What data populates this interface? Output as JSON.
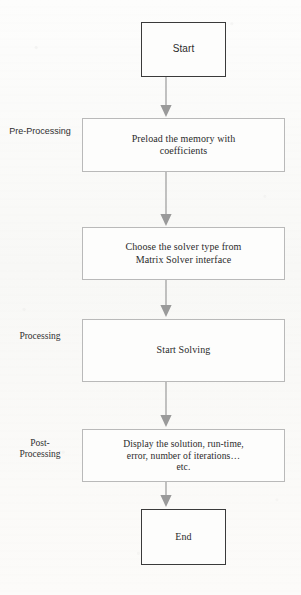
{
  "diagram": {
    "colors": {
      "page_background": "#fbfbfa",
      "box_fill": "#fdfdfc",
      "terminator_border": "#3a3a3a",
      "process_border": "#b9b9b9",
      "arrow": "#9a9a9a",
      "text": "#2b2b2b"
    },
    "stages": [
      {
        "id": "pre-processing",
        "caption": "Pre-Processing"
      },
      {
        "id": "processing",
        "caption": "Processing"
      },
      {
        "id": "post-processing",
        "caption": "Post-\nProcessing"
      }
    ],
    "nodes": [
      {
        "id": "start",
        "shape": "terminator",
        "text": "Start"
      },
      {
        "id": "preload-memory",
        "shape": "process",
        "text": "Preload the memory with\ncoefficients"
      },
      {
        "id": "choose-solver",
        "shape": "process",
        "text": "Choose the solver type from\nMatrix Solver interface"
      },
      {
        "id": "start-solving",
        "shape": "process",
        "text": "Start Solving"
      },
      {
        "id": "display-results",
        "shape": "process",
        "text": "Display the solution, run-time,\nerror, number of iterations…\netc."
      },
      {
        "id": "end",
        "shape": "terminator",
        "text": "End"
      }
    ],
    "connectors": [
      {
        "id": "start-to-preload",
        "from": "start",
        "to": "preload-memory",
        "marker": "arrow-down-icon"
      },
      {
        "id": "preload-to-choose",
        "from": "preload-memory",
        "to": "choose-solver",
        "marker": "arrow-down-icon"
      },
      {
        "id": "choose-to-solve",
        "from": "choose-solver",
        "to": "start-solving",
        "marker": "arrow-down-icon"
      },
      {
        "id": "solve-to-display",
        "from": "start-solving",
        "to": "display-results",
        "marker": "arrow-down-icon"
      },
      {
        "id": "display-to-end",
        "from": "display-results",
        "to": "end",
        "marker": "arrow-down-icon"
      }
    ]
  }
}
